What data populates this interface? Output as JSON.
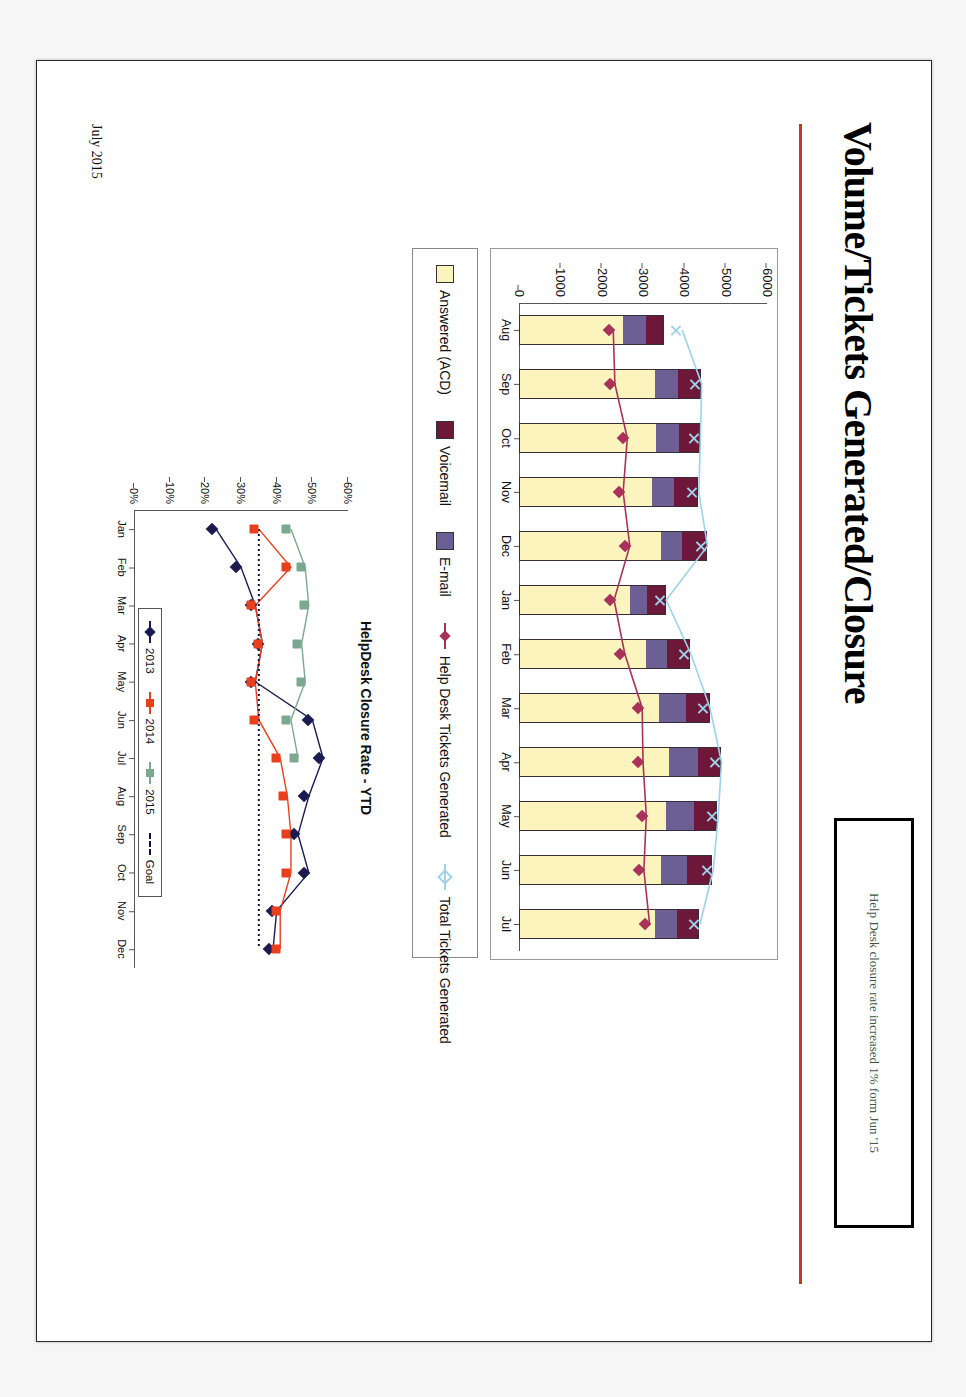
{
  "slide": {
    "title": "Volume/Tickets Generated/Closure",
    "footer_date": "July 2015",
    "callout_text": "Help Desk closure rate increased 1% form Jun '15",
    "accent_color": "#c0392b"
  },
  "chart_data": [
    {
      "id": "volume-chart",
      "type": "bar",
      "stacked": true,
      "title": "",
      "xlabel": "",
      "ylabel": "",
      "ylim": [
        0,
        6000
      ],
      "yticks": [
        0,
        1000,
        2000,
        3000,
        4000,
        5000,
        6000
      ],
      "ytick_labels": [
        "0",
        "1000",
        "2000",
        "3000",
        "4000",
        "5000",
        "6000"
      ],
      "grid": false,
      "legend_position": "below",
      "categories": [
        "Aug",
        "Sep",
        "Oct",
        "Nov",
        "Dec",
        "Jan",
        "Feb",
        "Mar",
        "Apr",
        "May",
        "Jun",
        "Jul"
      ],
      "series": [
        {
          "name": "Answered (ACD)",
          "kind": "bar-segment",
          "color": "#fbf5bd",
          "values": [
            2520,
            3300,
            3330,
            3240,
            3450,
            2700,
            3080,
            3400,
            3640,
            3560,
            3440,
            3310
          ]
        },
        {
          "name": "Voicemail",
          "kind": "bar-segment",
          "color": "#6b5f93",
          "values": [
            560,
            560,
            560,
            540,
            520,
            420,
            520,
            650,
            700,
            700,
            650,
            520
          ]
        },
        {
          "name": "E-mail",
          "kind": "bar-segment",
          "color": "#6d1739",
          "values": [
            430,
            540,
            480,
            560,
            580,
            430,
            540,
            560,
            540,
            540,
            590,
            530
          ]
        },
        {
          "name": "Total Tickets Generated",
          "kind": "line-x",
          "color": "#9fd2e8",
          "values": [
            3950,
            4420,
            4390,
            4350,
            4560,
            3560,
            4160,
            4620,
            4900,
            4820,
            4700,
            4380
          ]
        },
        {
          "name": "Help Desk Tickets Generated",
          "kind": "line-diamond",
          "color": "#a8325a",
          "values": [
            2280,
            2320,
            2620,
            2520,
            2680,
            2300,
            2560,
            2980,
            3000,
            3080,
            3020,
            3160
          ]
        }
      ]
    },
    {
      "id": "closure-rate-chart",
      "type": "line",
      "title": "HelpDesk Closure Rate - YTD",
      "xlabel": "",
      "ylabel": "",
      "ylim": [
        0,
        60
      ],
      "yticks": [
        0,
        10,
        20,
        30,
        40,
        50,
        60
      ],
      "ytick_labels": [
        "0%",
        "10%",
        "20%",
        "30%",
        "40%",
        "50%",
        "60%"
      ],
      "grid": false,
      "legend_position": "inside-bottom",
      "categories": [
        "Jan",
        "Feb",
        "Mar",
        "Apr",
        "May",
        "Jun",
        "Jul",
        "Aug",
        "Sep",
        "Oct",
        "Nov",
        "Dec"
      ],
      "series": [
        {
          "name": "2013",
          "color": "#1b1b4f",
          "marker": "diamond",
          "values": [
            23,
            30,
            34,
            36,
            34,
            50,
            53,
            49,
            46,
            49,
            40,
            39
          ]
        },
        {
          "name": "2014",
          "color": "#e8401f",
          "marker": "square",
          "values": [
            35,
            44,
            34,
            36,
            34,
            35,
            41,
            43,
            44,
            44,
            41,
            41
          ]
        },
        {
          "name": "2015",
          "color": "#7da890",
          "marker": "square",
          "values": [
            44,
            48,
            49,
            47,
            48,
            44,
            46,
            null,
            null,
            null,
            null,
            null
          ]
        },
        {
          "name": "Goal",
          "color": "#11114a",
          "marker": "none",
          "style": "dashed",
          "values": [
            35,
            35,
            35,
            35,
            35,
            35,
            35,
            35,
            35,
            35,
            35,
            35
          ]
        }
      ]
    }
  ],
  "legend_top": [
    {
      "label": "Answered (ACD)",
      "type": "swatch",
      "color": "#fbf5bd"
    },
    {
      "label": "Voicemail",
      "type": "swatch",
      "color": "#6d1739"
    },
    {
      "label": "E-mail",
      "type": "swatch",
      "color": "#6b5f93"
    },
    {
      "label": "Help Desk Tickets Generated",
      "type": "line-diamond",
      "color": "#a8325a"
    },
    {
      "label": "Total Tickets Generated",
      "type": "line-x",
      "color": "#9fd2e8"
    }
  ],
  "legend_bottom": [
    {
      "label": "2013",
      "color": "#1b1b4f",
      "marker": "diamond"
    },
    {
      "label": "2014",
      "color": "#e8401f",
      "marker": "square"
    },
    {
      "label": "2015",
      "color": "#7da890",
      "marker": "square"
    },
    {
      "label": "Goal",
      "color": "#11114a",
      "marker": "dashed"
    }
  ]
}
